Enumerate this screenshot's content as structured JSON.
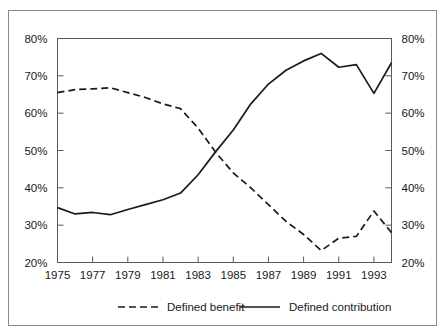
{
  "chart_data": {
    "type": "line",
    "title": "",
    "subtitle": "",
    "xlabel": "",
    "ylabel": "",
    "xlim": [
      1975,
      1994
    ],
    "ylim": [
      20,
      80
    ],
    "grid": false,
    "legend_position": "bottom",
    "dual_axis": true,
    "x": [
      1975,
      1976,
      1977,
      1978,
      1979,
      1980,
      1981,
      1982,
      1983,
      1984,
      1985,
      1986,
      1987,
      1988,
      1989,
      1990,
      1991,
      1992,
      1993,
      1994
    ],
    "xticklabels": [
      "1975",
      "1977",
      "1979",
      "1981",
      "1983",
      "1985",
      "1987",
      "1989",
      "1991",
      "1993"
    ],
    "xtickvalues": [
      1975,
      1977,
      1979,
      1981,
      1983,
      1985,
      1987,
      1989,
      1991,
      1993
    ],
    "yticklabels": [
      "20%",
      "30%",
      "40%",
      "50%",
      "60%",
      "70%",
      "80%"
    ],
    "ytickvalues": [
      20,
      30,
      40,
      50,
      60,
      70,
      80
    ],
    "yticklabels_right": [
      "20%",
      "30%",
      "40%",
      "50%",
      "60%",
      "70%",
      "80%"
    ],
    "series": [
      {
        "name": "Defined benefit",
        "style": "dashed",
        "color": "#1a1a1a",
        "values": [
          65.5,
          66.3,
          66.5,
          66.8,
          65.5,
          64.2,
          62.5,
          61.2,
          56.0,
          49.5,
          44.0,
          40.0,
          35.5,
          31.0,
          27.5,
          23.2,
          26.5,
          27.0,
          33.8,
          28.0
        ]
      },
      {
        "name": "Defined contribution",
        "style": "solid",
        "color": "#1a1a1a",
        "values": [
          34.7,
          33.0,
          33.4,
          32.8,
          34.2,
          35.5,
          36.8,
          38.6,
          43.5,
          49.7,
          55.5,
          62.5,
          67.8,
          71.5,
          74.0,
          76.0,
          72.3,
          73.0,
          65.3,
          73.5
        ]
      }
    ]
  },
  "legend": {
    "items": [
      {
        "label": "Defined benefit",
        "style": "dashed"
      },
      {
        "label": "Defined contribution",
        "style": "solid"
      }
    ]
  },
  "colors": {
    "line": "#1a1a1a",
    "axis": "#595959",
    "frame": "#8c8c8c",
    "background": "#ffffff"
  }
}
